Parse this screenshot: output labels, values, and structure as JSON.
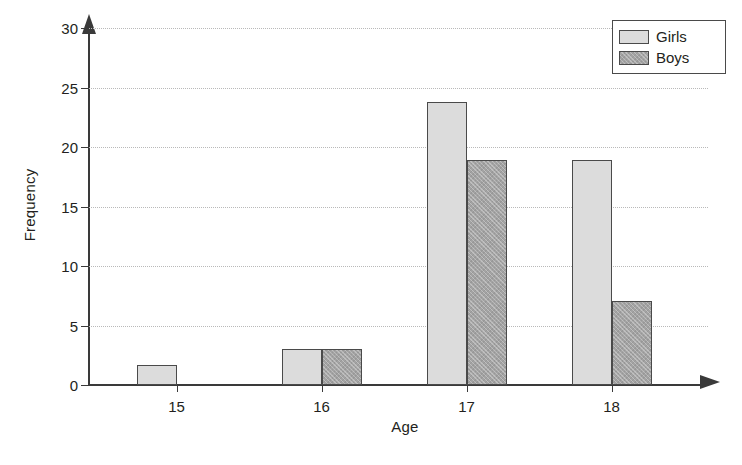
{
  "chart_data": {
    "type": "bar",
    "title": "",
    "subtitle": "",
    "xlabel": "Age",
    "ylabel": "Frequency",
    "categories": [
      "15",
      "16",
      "17",
      "18"
    ],
    "series": [
      {
        "name": "Girls",
        "values": [
          1.7,
          3,
          23.8,
          18.9
        ],
        "color": "#dcdcdc"
      },
      {
        "name": "Boys",
        "values": [
          0,
          3,
          18.9,
          7.1
        ],
        "color": "#a3a3a3"
      }
    ],
    "ylim": [
      0,
      30
    ],
    "yticks": [
      0,
      5,
      10,
      15,
      20,
      25,
      30
    ],
    "ytick_labels": [
      "0",
      "5",
      "10",
      "15",
      "20",
      "25",
      "30"
    ],
    "xtick_labels": [
      "15",
      "16",
      "17",
      "18"
    ],
    "grid": true,
    "grid_style": "dotted",
    "grid_axis": "y",
    "legend_position": "top-right",
    "legend_entries": [
      "Girls",
      "Boys"
    ],
    "axis_arrows": true
  },
  "axes": {
    "y_title": "Frequency",
    "x_title": "Age"
  },
  "legend": {
    "items": [
      {
        "label": "Girls"
      },
      {
        "label": "Boys"
      }
    ]
  }
}
